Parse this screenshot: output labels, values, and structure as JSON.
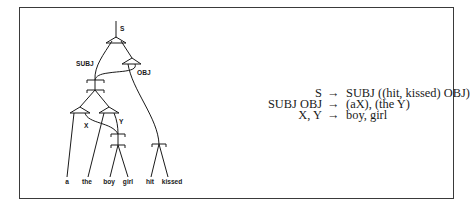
{
  "diagram": {
    "tree": {
      "node_labels": {
        "root": "S",
        "subj": "SUBJ",
        "obj": "OBJ",
        "x": "X",
        "y": "Y"
      },
      "leaves": [
        "a",
        "the",
        "boy",
        "girl",
        "hit",
        "kissed"
      ]
    },
    "rules": [
      {
        "lhs": "S",
        "arrow": "→",
        "rhs": "SUBJ ((hit, kissed) OBJ)"
      },
      {
        "lhs": "SUBJ OBJ",
        "arrow": "→",
        "rhs": "(aX), (the Y)"
      },
      {
        "lhs": "X, Y",
        "arrow": "→",
        "rhs": "boy, girl"
      }
    ]
  }
}
